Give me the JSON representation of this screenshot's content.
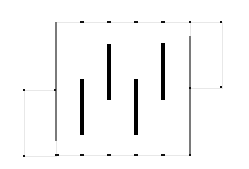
{
  "diagram": {
    "background": "#ffffff",
    "faint_box_color": "#e8e8e8",
    "gray_line_color": "#7a7a7a",
    "bar_color": "#000000",
    "marker_color": "#111111",
    "faint_boxes": [
      {
        "x": 56,
        "y": 22,
        "w": 134,
        "h": 133
      },
      {
        "x": 190,
        "y": 22,
        "w": 32,
        "h": 66
      },
      {
        "x": 24,
        "y": 90,
        "w": 32,
        "h": 66
      }
    ],
    "gray_lines": [
      {
        "x": 56,
        "y1": 22,
        "y2": 141
      },
      {
        "x": 190,
        "y1": 36,
        "y2": 155
      }
    ],
    "bars": [
      {
        "x": 82,
        "y1": 79,
        "y2": 135
      },
      {
        "x": 109,
        "y1": 44,
        "y2": 100
      },
      {
        "x": 136,
        "y1": 79,
        "y2": 135
      },
      {
        "x": 163,
        "y1": 43,
        "y2": 100
      }
    ],
    "dashes": [
      {
        "x": 82,
        "y": 22
      },
      {
        "x": 109,
        "y": 22
      },
      {
        "x": 136,
        "y": 22
      },
      {
        "x": 163,
        "y": 22
      },
      {
        "x": 57,
        "y": 155
      },
      {
        "x": 82,
        "y": 155
      },
      {
        "x": 109,
        "y": 155
      },
      {
        "x": 136,
        "y": 155
      },
      {
        "x": 163,
        "y": 155
      }
    ],
    "dots": [
      {
        "x": 190,
        "y": 22
      },
      {
        "x": 221,
        "y": 22
      },
      {
        "x": 190,
        "y": 88
      },
      {
        "x": 221,
        "y": 87
      },
      {
        "x": 24,
        "y": 90
      },
      {
        "x": 55,
        "y": 90
      },
      {
        "x": 24,
        "y": 156
      },
      {
        "x": 190,
        "y": 155
      }
    ]
  }
}
